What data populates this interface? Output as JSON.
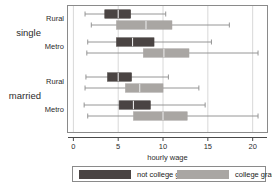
{
  "chart_data": {
    "type": "boxplot",
    "title": "",
    "xlabel": "hourly wage",
    "ylabel": "",
    "xlim": [
      -0.6,
      21.6
    ],
    "xticks": [
      0,
      5,
      10,
      15,
      20
    ],
    "xticklabels": [
      "0",
      "5",
      "10",
      "15",
      "20"
    ],
    "grid": "vertical-light",
    "orientation": "horizontal",
    "group_labels": [
      "single",
      "married"
    ],
    "category_labels": [
      "Rural",
      "Metro",
      "Rural",
      "Metro"
    ],
    "legend": {
      "position": "below-axis",
      "entries": [
        {
          "label": "not college grad",
          "color": "#4a4443"
        },
        {
          "label": "college grad",
          "color": "#a9a6a3"
        }
      ]
    },
    "colors": {
      "not_college_grad": "#4a4443",
      "college_grad": "#a9a6a3",
      "whisker": "#8a8a8a",
      "median": "#e8e8e8",
      "frame": "#8a8a8a",
      "gridline": "#d8d8d8",
      "background": "#ffffff"
    },
    "groups": [
      {
        "name": "single",
        "categories": [
          {
            "name": "Rural",
            "boxes": [
              {
                "series": "not college grad",
                "min": 1.3,
                "q1": 3.5,
                "median": 5.0,
                "q3": 6.4,
                "max": 10.3
              },
              {
                "series": "college grad",
                "min": 2.0,
                "q1": 4.8,
                "median": 8.1,
                "q3": 11.0,
                "max": 17.4
              }
            ]
          },
          {
            "name": "Metro",
            "boxes": [
              {
                "series": "not college grad",
                "min": 1.6,
                "q1": 4.8,
                "median": 6.6,
                "q3": 9.0,
                "max": 15.4
              },
              {
                "series": "college grad",
                "min": 1.5,
                "q1": 7.8,
                "median": 10.1,
                "q3": 12.9,
                "max": 20.6
              }
            ]
          }
        ]
      },
      {
        "name": "married",
        "categories": [
          {
            "name": "Rural",
            "boxes": [
              {
                "series": "not college grad",
                "min": 1.4,
                "q1": 3.8,
                "median": 5.0,
                "q3": 6.5,
                "max": 10.6
              },
              {
                "series": "college grad",
                "min": 1.3,
                "q1": 5.8,
                "median": 7.4,
                "q3": 10.0,
                "max": 14.0
              }
            ]
          },
          {
            "name": "Metro",
            "boxes": [
              {
                "series": "not college grad",
                "min": 1.2,
                "q1": 5.1,
                "median": 6.7,
                "q3": 8.6,
                "max": 14.7
              },
              {
                "series": "college grad",
                "min": 1.6,
                "q1": 6.7,
                "median": 10.0,
                "q3": 12.7,
                "max": 20.6
              }
            ]
          }
        ]
      }
    ]
  },
  "axis": {
    "xlabel": "hourly wage",
    "ticks": [
      "0",
      "5",
      "10",
      "15",
      "20"
    ]
  },
  "labels": {
    "group_single": "single",
    "group_married": "married",
    "cat_rural_1": "Rural",
    "cat_metro_1": "Metro",
    "cat_rural_2": "Rural",
    "cat_metro_2": "Metro"
  },
  "legend": {
    "not_college_grad": "not college grad",
    "college_grad": "college grad"
  }
}
